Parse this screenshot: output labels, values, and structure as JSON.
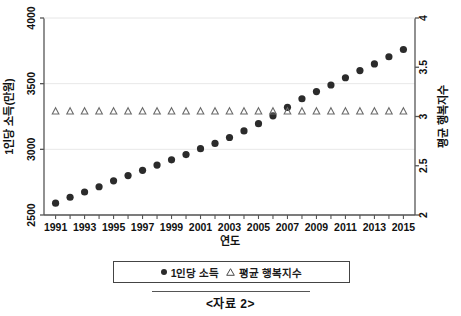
{
  "caption": "<자료 2>",
  "legend": {
    "position": "bottom",
    "items": [
      {
        "label": "1인당 소득",
        "marker": "filled-circle"
      },
      {
        "label": "평균 행복지수",
        "marker": "open-triangle"
      }
    ]
  },
  "axes": {
    "x_title": "연도",
    "y_left_title": "1인당 소득(만원)",
    "y_right_title": "평균 행복지수",
    "y_left_ticks": [
      "2500",
      "3000",
      "3500",
      "4000"
    ],
    "y_right_ticks": [
      "2",
      "2.5",
      "3",
      "3.5",
      "4"
    ],
    "x_ticks": [
      "1991",
      "1993",
      "1995",
      "1997",
      "1999",
      "2001",
      "2003",
      "2005",
      "2007",
      "2009",
      "2011",
      "2013",
      "2015"
    ]
  },
  "colors": {
    "income_marker": "#2b2b2b",
    "happiness_marker": "#6b6b6b",
    "grid": "#e8e8e8",
    "axis": "#555555",
    "text": "#111111"
  },
  "chart_data": {
    "type": "scatter",
    "title": "",
    "xlabel": "연도",
    "ylabel": "1인당 소득(만원)",
    "y2label": "평균 행복지수",
    "grid": true,
    "legend_position": "bottom",
    "xlim": [
      1990.2,
      2015.8
    ],
    "ylim": [
      2500,
      4000
    ],
    "y2lim": [
      2,
      4
    ],
    "x": [
      1991,
      1992,
      1993,
      1994,
      1995,
      1996,
      1997,
      1998,
      1999,
      2000,
      2001,
      2002,
      2003,
      2004,
      2005,
      2006,
      2007,
      2008,
      2009,
      2010,
      2011,
      2012,
      2013,
      2014,
      2015
    ],
    "series": [
      {
        "name": "1인당 소득",
        "axis": "left",
        "marker": "filled-circle",
        "values": [
          2590,
          2635,
          2675,
          2715,
          2760,
          2800,
          2840,
          2880,
          2920,
          2960,
          3005,
          3045,
          3090,
          3140,
          3195,
          3255,
          3320,
          3385,
          3440,
          3490,
          3545,
          3600,
          3650,
          3705,
          3760
        ]
      },
      {
        "name": "평균 행복지수",
        "axis": "right",
        "marker": "open-triangle",
        "values": [
          3.05,
          3.05,
          3.05,
          3.05,
          3.05,
          3.05,
          3.05,
          3.05,
          3.05,
          3.05,
          3.05,
          3.05,
          3.05,
          3.05,
          3.05,
          3.05,
          3.05,
          3.05,
          3.05,
          3.05,
          3.05,
          3.05,
          3.05,
          3.05,
          3.05
        ]
      }
    ]
  }
}
